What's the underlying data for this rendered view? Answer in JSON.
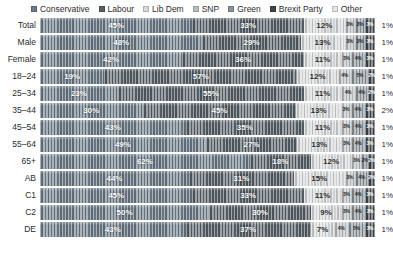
{
  "legend": {
    "position": "top",
    "items": [
      {
        "label": "Conservative",
        "color": "#6b7a86"
      },
      {
        "label": "Labour",
        "color": "#555f66"
      },
      {
        "label": "Lib Dem",
        "color": "#d7d9da"
      },
      {
        "label": "SNP",
        "color": "#b9bdc0"
      },
      {
        "label": "Green",
        "color": "#8a9298"
      },
      {
        "label": "Brexit Party",
        "color": "#3f464b"
      },
      {
        "label": "Other",
        "color": "#e3e4e5"
      }
    ]
  },
  "chart_data": {
    "type": "bar",
    "title": "",
    "subtitle": "",
    "xlabel": "",
    "ylabel": "",
    "orientation": "horizontal",
    "stacked": true,
    "normalized": true,
    "xlim": [
      0,
      100
    ],
    "grid": false,
    "legend_position": "top",
    "categories": [
      "Total",
      "Male",
      "Female",
      "18–24",
      "25–34",
      "35–44",
      "45–54",
      "55–64",
      "65+",
      "AB",
      "C1",
      "C2",
      "DE"
    ],
    "series": [
      {
        "name": "Conservative",
        "color": "#6b7a86",
        "values": [
          45,
          48,
          42,
          19,
          23,
          30,
          43,
          49,
          62,
          44,
          45,
          50,
          43
        ]
      },
      {
        "name": "Labour",
        "color": "#555f66",
        "values": [
          33,
          29,
          36,
          57,
          55,
          45,
          35,
          27,
          18,
          31,
          33,
          30,
          37
        ]
      },
      {
        "name": "Lib Dem",
        "color": "#d7d9da",
        "values": [
          12,
          13,
          11,
          12,
          11,
          13,
          11,
          13,
          12,
          15,
          11,
          9,
          7
        ]
      },
      {
        "name": "SNP",
        "color": "#b9bdc0",
        "values": [
          3,
          3,
          3,
          4,
          4,
          3,
          3,
          3,
          3,
          3,
          3,
          3,
          4
        ]
      },
      {
        "name": "Green",
        "color": "#8a9298",
        "values": [
          3,
          3,
          4,
          5,
          4,
          4,
          4,
          4,
          2,
          4,
          4,
          4,
          5
        ]
      },
      {
        "name": "Brexit Party",
        "color": "#3f464b",
        "values": [
          3,
          3,
          3,
          2,
          2,
          3,
          3,
          3,
          2,
          2,
          3,
          3,
          3
        ]
      },
      {
        "name": "Other",
        "color": "#e3e4e5",
        "values": [
          1,
          1,
          1,
          1,
          1,
          2,
          1,
          1,
          1,
          1,
          1,
          1,
          1
        ]
      }
    ]
  },
  "rows": [
    {
      "label": "Total",
      "segments": [
        {
          "party": "Conservative",
          "value": 45,
          "text": "45%",
          "show": true,
          "tone": "dark"
        },
        {
          "party": "Labour",
          "value": 33,
          "text": "33%",
          "show": true,
          "tone": "dark"
        },
        {
          "party": "Lib Dem",
          "value": 12,
          "text": "12%",
          "show": true,
          "tone": "light"
        },
        {
          "party": "SNP",
          "value": 3,
          "text": "3%",
          "show": true,
          "tone": "tiny-light"
        },
        {
          "party": "Green",
          "value": 3,
          "text": "3%",
          "show": true,
          "tone": "tiny-light"
        },
        {
          "party": "Brexit Party",
          "value": 3,
          "text": "3%",
          "show": true,
          "tone": "tiny-dark"
        }
      ],
      "outer": "1%"
    },
    {
      "label": "Male",
      "segments": [
        {
          "party": "Conservative",
          "value": 48,
          "text": "48%",
          "show": true,
          "tone": "dark"
        },
        {
          "party": "Labour",
          "value": 29,
          "text": "29%",
          "show": true,
          "tone": "dark"
        },
        {
          "party": "Lib Dem",
          "value": 13,
          "text": "13%",
          "show": true,
          "tone": "light"
        },
        {
          "party": "SNP",
          "value": 3,
          "text": "3%",
          "show": true,
          "tone": "tiny-light"
        },
        {
          "party": "Green",
          "value": 3,
          "text": "3%",
          "show": true,
          "tone": "tiny-light"
        },
        {
          "party": "Brexit Party",
          "value": 3,
          "text": "3%",
          "show": true,
          "tone": "tiny-dark"
        }
      ],
      "outer": "1%"
    },
    {
      "label": "Female",
      "segments": [
        {
          "party": "Conservative",
          "value": 42,
          "text": "42%",
          "show": true,
          "tone": "dark"
        },
        {
          "party": "Labour",
          "value": 36,
          "text": "36%",
          "show": true,
          "tone": "dark"
        },
        {
          "party": "Lib Dem",
          "value": 11,
          "text": "11%",
          "show": true,
          "tone": "light"
        },
        {
          "party": "SNP",
          "value": 3,
          "text": "3%",
          "show": true,
          "tone": "tiny-light"
        },
        {
          "party": "Green",
          "value": 4,
          "text": "4%",
          "show": true,
          "tone": "tiny-light"
        },
        {
          "party": "Brexit Party",
          "value": 3,
          "text": "3%",
          "show": true,
          "tone": "tiny-dark"
        }
      ],
      "outer": "1%"
    },
    {
      "label": "18–24",
      "segments": [
        {
          "party": "Conservative",
          "value": 19,
          "text": "19%",
          "show": true,
          "tone": "dark"
        },
        {
          "party": "Labour",
          "value": 57,
          "text": "57%",
          "show": true,
          "tone": "dark"
        },
        {
          "party": "Lib Dem",
          "value": 12,
          "text": "12%",
          "show": true,
          "tone": "light"
        },
        {
          "party": "SNP",
          "value": 4,
          "text": "4%",
          "show": true,
          "tone": "tiny-light"
        },
        {
          "party": "Green",
          "value": 5,
          "text": "5%",
          "show": true,
          "tone": "tiny-light"
        },
        {
          "party": "Brexit Party",
          "value": 2,
          "text": "2%",
          "show": true,
          "tone": "tiny-dark"
        }
      ],
      "outer": "1%"
    },
    {
      "label": "25–34",
      "segments": [
        {
          "party": "Conservative",
          "value": 23,
          "text": "23%",
          "show": true,
          "tone": "dark"
        },
        {
          "party": "Labour",
          "value": 55,
          "text": "55%",
          "show": true,
          "tone": "dark"
        },
        {
          "party": "Lib Dem",
          "value": 11,
          "text": "11%",
          "show": true,
          "tone": "light"
        },
        {
          "party": "SNP",
          "value": 4,
          "text": "4%",
          "show": true,
          "tone": "tiny-light"
        },
        {
          "party": "Green",
          "value": 4,
          "text": "4%",
          "show": true,
          "tone": "tiny-light"
        },
        {
          "party": "Brexit Party",
          "value": 2,
          "text": "2%",
          "show": true,
          "tone": "tiny-dark"
        }
      ],
      "outer": "1%"
    },
    {
      "label": "35–44",
      "segments": [
        {
          "party": "Conservative",
          "value": 30,
          "text": "30%",
          "show": true,
          "tone": "dark"
        },
        {
          "party": "Labour",
          "value": 45,
          "text": "45%",
          "show": true,
          "tone": "dark"
        },
        {
          "party": "Lib Dem",
          "value": 13,
          "text": "13%",
          "show": true,
          "tone": "light"
        },
        {
          "party": "SNP",
          "value": 3,
          "text": "3%",
          "show": true,
          "tone": "tiny-light"
        },
        {
          "party": "Green",
          "value": 4,
          "text": "4%",
          "show": true,
          "tone": "tiny-light"
        },
        {
          "party": "Brexit Party",
          "value": 3,
          "text": "3%",
          "show": true,
          "tone": "tiny-dark"
        }
      ],
      "outer": "2%"
    },
    {
      "label": "45–54",
      "segments": [
        {
          "party": "Conservative",
          "value": 43,
          "text": "43%",
          "show": true,
          "tone": "dark"
        },
        {
          "party": "Labour",
          "value": 35,
          "text": "35%",
          "show": true,
          "tone": "dark"
        },
        {
          "party": "Lib Dem",
          "value": 11,
          "text": "11%",
          "show": true,
          "tone": "light"
        },
        {
          "party": "SNP",
          "value": 3,
          "text": "3%",
          "show": true,
          "tone": "tiny-light"
        },
        {
          "party": "Green",
          "value": 4,
          "text": "4%",
          "show": true,
          "tone": "tiny-light"
        },
        {
          "party": "Brexit Party",
          "value": 3,
          "text": "3%",
          "show": true,
          "tone": "tiny-dark"
        }
      ],
      "outer": "1%"
    },
    {
      "label": "55–64",
      "segments": [
        {
          "party": "Conservative",
          "value": 49,
          "text": "49%",
          "show": true,
          "tone": "dark"
        },
        {
          "party": "Labour",
          "value": 27,
          "text": "27%",
          "show": true,
          "tone": "dark"
        },
        {
          "party": "Lib Dem",
          "value": 13,
          "text": "13%",
          "show": true,
          "tone": "light"
        },
        {
          "party": "SNP",
          "value": 3,
          "text": "3%",
          "show": true,
          "tone": "tiny-light"
        },
        {
          "party": "Green",
          "value": 4,
          "text": "4%",
          "show": true,
          "tone": "tiny-light"
        },
        {
          "party": "Brexit Party",
          "value": 3,
          "text": "3%",
          "show": true,
          "tone": "tiny-dark"
        }
      ],
      "outer": "1%"
    },
    {
      "label": "65+",
      "segments": [
        {
          "party": "Conservative",
          "value": 62,
          "text": "62%",
          "show": true,
          "tone": "dark"
        },
        {
          "party": "Labour",
          "value": 18,
          "text": "18%",
          "show": true,
          "tone": "dark"
        },
        {
          "party": "Lib Dem",
          "value": 12,
          "text": "12%",
          "show": true,
          "tone": "light"
        },
        {
          "party": "SNP",
          "value": 3,
          "text": "3%",
          "show": true,
          "tone": "tiny-light"
        },
        {
          "party": "Green",
          "value": 2,
          "text": "2%",
          "show": true,
          "tone": "tiny-light"
        },
        {
          "party": "Brexit Party",
          "value": 2,
          "text": "2%",
          "show": true,
          "tone": "tiny-dark"
        }
      ],
      "outer": "1%"
    },
    {
      "label": "AB",
      "segments": [
        {
          "party": "Conservative",
          "value": 44,
          "text": "44%",
          "show": true,
          "tone": "dark"
        },
        {
          "party": "Labour",
          "value": 31,
          "text": "31%",
          "show": true,
          "tone": "dark"
        },
        {
          "party": "Lib Dem",
          "value": 15,
          "text": "15%",
          "show": true,
          "tone": "light"
        },
        {
          "party": "SNP",
          "value": 3,
          "text": "3%",
          "show": true,
          "tone": "tiny-light"
        },
        {
          "party": "Green",
          "value": 4,
          "text": "4%",
          "show": true,
          "tone": "tiny-light"
        },
        {
          "party": "Brexit Party",
          "value": 2,
          "text": "2%",
          "show": true,
          "tone": "tiny-dark"
        }
      ],
      "outer": "1%"
    },
    {
      "label": "C1",
      "segments": [
        {
          "party": "Conservative",
          "value": 45,
          "text": "45%",
          "show": true,
          "tone": "dark"
        },
        {
          "party": "Labour",
          "value": 33,
          "text": "33%",
          "show": true,
          "tone": "dark"
        },
        {
          "party": "Lib Dem",
          "value": 11,
          "text": "11%",
          "show": true,
          "tone": "light"
        },
        {
          "party": "SNP",
          "value": 3,
          "text": "3%",
          "show": true,
          "tone": "tiny-light"
        },
        {
          "party": "Green",
          "value": 4,
          "text": "4%",
          "show": true,
          "tone": "tiny-light"
        },
        {
          "party": "Brexit Party",
          "value": 3,
          "text": "3%",
          "show": true,
          "tone": "tiny-dark"
        }
      ],
      "outer": "1%"
    },
    {
      "label": "C2",
      "segments": [
        {
          "party": "Conservative",
          "value": 50,
          "text": "50%",
          "show": true,
          "tone": "dark"
        },
        {
          "party": "Labour",
          "value": 30,
          "text": "30%",
          "show": true,
          "tone": "dark"
        },
        {
          "party": "Lib Dem",
          "value": 9,
          "text": "9%",
          "show": true,
          "tone": "light"
        },
        {
          "party": "SNP",
          "value": 3,
          "text": "3%",
          "show": true,
          "tone": "tiny-light"
        },
        {
          "party": "Green",
          "value": 4,
          "text": "4%",
          "show": true,
          "tone": "tiny-light"
        },
        {
          "party": "Brexit Party",
          "value": 3,
          "text": "3%",
          "show": true,
          "tone": "tiny-dark"
        }
      ],
      "outer": "1%"
    },
    {
      "label": "DE",
      "segments": [
        {
          "party": "Conservative",
          "value": 43,
          "text": "43%",
          "show": true,
          "tone": "dark"
        },
        {
          "party": "Labour",
          "value": 37,
          "text": "37%",
          "show": true,
          "tone": "dark"
        },
        {
          "party": "Lib Dem",
          "value": 7,
          "text": "7%",
          "show": true,
          "tone": "light"
        },
        {
          "party": "SNP",
          "value": 4,
          "text": "4%",
          "show": true,
          "tone": "tiny-light"
        },
        {
          "party": "Green",
          "value": 5,
          "text": "5%",
          "show": true,
          "tone": "tiny-light"
        },
        {
          "party": "Brexit Party",
          "value": 3,
          "text": "3%",
          "show": true,
          "tone": "tiny-dark"
        }
      ],
      "outer": "1%"
    }
  ]
}
